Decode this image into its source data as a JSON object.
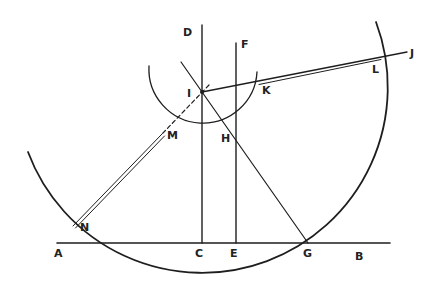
{
  "diagram": {
    "type": "geometric construction",
    "background": "#ffffff",
    "ink_color": "#1e1e1e",
    "labels": {
      "A": "A",
      "B": "B",
      "C": "C",
      "D": "D",
      "E": "E",
      "F": "F",
      "G": "G",
      "H": "H",
      "I": "I",
      "J": "J",
      "K": "K",
      "L": "L",
      "M": "M",
      "N": "N"
    },
    "points": {
      "A": [
        57,
        243
      ],
      "B": [
        390,
        243
      ],
      "C": [
        202,
        243
      ],
      "D": [
        202,
        25
      ],
      "E": [
        236,
        243
      ],
      "F": [
        236,
        43
      ],
      "G": [
        308,
        243
      ],
      "H": [
        236,
        140
      ],
      "I": [
        202,
        92
      ],
      "J": [
        407,
        52
      ],
      "K": [
        259,
        82
      ],
      "L": [
        381,
        57
      ],
      "M": [
        162,
        134
      ],
      "N": [
        73,
        226
      ]
    },
    "elements": [
      {
        "kind": "line",
        "from": "A",
        "to": "B",
        "desc": "horizontal base line AB"
      },
      {
        "kind": "line",
        "from": "D",
        "to": "C",
        "desc": "vertical line DC through I"
      },
      {
        "kind": "line",
        "from": "F",
        "to": "E",
        "desc": "vertical line FE through H"
      },
      {
        "kind": "line",
        "from": "I",
        "to": "G",
        "desc": "line through I and H to G, extended above I"
      },
      {
        "kind": "line",
        "from": "I",
        "to": "J",
        "desc": "line from I to J"
      },
      {
        "kind": "double-line",
        "from": "K",
        "to": "L"
      },
      {
        "kind": "dashed-line",
        "from": "I",
        "to": "M"
      },
      {
        "kind": "double-line",
        "from": "M",
        "to": "N"
      },
      {
        "kind": "arc",
        "center": "I",
        "radius": 50,
        "desc": "small circle arc through M, H, K"
      },
      {
        "kind": "arc",
        "center": "I",
        "radius": 181,
        "desc": "large circle arc through N, G, L"
      }
    ]
  }
}
